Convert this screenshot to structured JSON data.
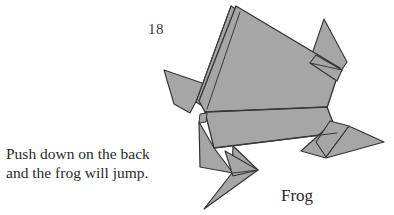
{
  "page": {
    "background_color": "#ffffff",
    "width": 394,
    "height": 215,
    "page_number": "18"
  },
  "figure": {
    "model_name": "Frog",
    "caption_line_1": "Push down on the back",
    "caption_line_2": "and the frog will jump.",
    "fill_color": "#a6a6a6",
    "stroke_color": "#333333",
    "illustration_type": "origami-diagram"
  },
  "illustration": {
    "shapes": [
      {
        "name": "left-arm-flap",
        "points": "164,70 205,84 190,113 174,104",
        "fill": "#a6a6a6"
      },
      {
        "name": "right-arm-flap",
        "points": "324,19 347,62 336,78 310,60",
        "fill": "#a6a6a6"
      },
      {
        "name": "body-edge-sliver",
        "points": "231,6 196,102 206,108 239,11",
        "fill": "#a6a6a6"
      },
      {
        "name": "upper-body-panel",
        "points": "236,6 339,68 326,106 205,110 199,101",
        "fill": "#a6a6a6"
      },
      {
        "name": "right-shoulder-wedge",
        "points": "317,56 341,70 337,80 311,64",
        "fill": "#a6a6a6"
      },
      {
        "name": "mid-band-panel",
        "points": "205,113 327,108 336,133 213,147",
        "fill": "#a6a6a6"
      },
      {
        "name": "lower-left-panel",
        "points": "204,118 213,147 232,172 200,166 196,124",
        "fill": "#a6a6a6"
      },
      {
        "name": "left-leg-flap",
        "points": "236,142 253,168 203,208 232,172 200,166",
        "fill": "#a6a6a6"
      },
      {
        "name": "left-foot-wedge",
        "points": "225,152 256,170 232,176",
        "fill": "#a6a6a6"
      },
      {
        "name": "right-leg-flap",
        "points": "330,125 350,127 383,141 325,157 300,150",
        "fill": "#a6a6a6"
      },
      {
        "name": "right-leg-upper",
        "points": "329,122 348,126 325,156 316,141",
        "fill": "#a6a6a6"
      }
    ],
    "fold_lines": [
      {
        "name": "body-left-crease",
        "path": "M231,6 L196,102"
      },
      {
        "name": "body-sliver-crease",
        "path": "M239,11 L206,108"
      },
      {
        "name": "mid-band-top-crease",
        "path": "M205,111 L327,107"
      },
      {
        "name": "mid-band-bottom-crease",
        "path": "M213,147 L336,132"
      },
      {
        "name": "left-leg-crease",
        "path": "M232,172 L256,170"
      },
      {
        "name": "right-leg-crease",
        "path": "M325,157 L348,126"
      }
    ]
  }
}
